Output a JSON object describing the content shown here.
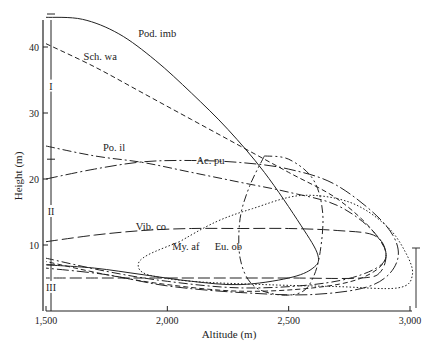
{
  "chart_data": {
    "type": "line",
    "title": "",
    "xlabel": "Altitude (m)",
    "ylabel": "Height (m)",
    "xlim": [
      1500,
      3050
    ],
    "ylim": [
      0,
      45
    ],
    "grid": false,
    "legend": "inline labels",
    "x_ticks": [
      {
        "value": 1500,
        "label": "1,500"
      },
      {
        "value": 2000,
        "label": "2,000"
      },
      {
        "value": 2500,
        "label": "2,500"
      },
      {
        "value": 3000,
        "label": "3,000"
      }
    ],
    "y_ticks": [
      {
        "value": 10,
        "label": "10"
      },
      {
        "value": 20,
        "label": "20"
      },
      {
        "value": 30,
        "label": "30"
      },
      {
        "value": 40,
        "label": "40"
      }
    ],
    "zones": [
      {
        "label": "I",
        "y_range": [
          23,
          45
        ]
      },
      {
        "label": "II",
        "y_range": [
          7,
          23
        ]
      },
      {
        "label": "III",
        "y_range": [
          0,
          7
        ]
      }
    ],
    "series": [
      {
        "name": "Pod. imb",
        "style": "solid",
        "label_pos": [
          1880,
          41.5
        ],
        "points": [
          [
            1500,
            44.5
          ],
          [
            1650,
            44.2
          ],
          [
            1800,
            42
          ],
          [
            1950,
            38
          ],
          [
            2100,
            33
          ],
          [
            2250,
            27.5
          ],
          [
            2400,
            21
          ],
          [
            2550,
            13
          ],
          [
            2620,
            8.5
          ],
          [
            2600,
            6.5
          ],
          [
            2500,
            5
          ],
          [
            2300,
            4
          ],
          [
            2100,
            4.5
          ],
          [
            1900,
            5.5
          ],
          [
            1700,
            6.5
          ],
          [
            1500,
            7
          ]
        ]
      },
      {
        "name": "Sch. wa",
        "style": "dashed",
        "label_pos": [
          1655,
          38
        ],
        "points": [
          [
            1500,
            40.5
          ],
          [
            1700,
            37
          ],
          [
            1900,
            33
          ],
          [
            2100,
            29
          ],
          [
            2300,
            25
          ],
          [
            2500,
            21
          ],
          [
            2700,
            17
          ],
          [
            2850,
            12
          ],
          [
            2900,
            8
          ],
          [
            2800,
            5
          ],
          [
            2600,
            3.5
          ],
          [
            2300,
            3
          ],
          [
            2000,
            4
          ],
          [
            1750,
            5.5
          ],
          [
            1500,
            7.5
          ]
        ]
      },
      {
        "name": "Po. il",
        "style": "dash-dot",
        "label_pos": [
          1735,
          24.2
        ],
        "points": [
          [
            1500,
            25
          ],
          [
            1700,
            23.5
          ],
          [
            1900,
            22.5
          ],
          [
            2100,
            21
          ],
          [
            2300,
            19.5
          ],
          [
            2500,
            18
          ],
          [
            2700,
            16
          ],
          [
            2850,
            12
          ],
          [
            2900,
            8
          ],
          [
            2800,
            5.5
          ],
          [
            2600,
            4
          ],
          [
            2300,
            3.5
          ],
          [
            2000,
            4.5
          ],
          [
            1750,
            6
          ],
          [
            1500,
            8
          ]
        ]
      },
      {
        "name": "Ac. pu",
        "style": "dash-dot-long",
        "label_pos": [
          2120,
          22.3
        ],
        "points": [
          [
            1500,
            20
          ],
          [
            1700,
            21.5
          ],
          [
            1900,
            22.6
          ],
          [
            2100,
            22.8
          ],
          [
            2300,
            22.5
          ],
          [
            2500,
            21.5
          ],
          [
            2700,
            19
          ],
          [
            2900,
            13
          ],
          [
            2950,
            8
          ],
          [
            2850,
            4
          ],
          [
            2600,
            2.5
          ],
          [
            2300,
            2.8
          ],
          [
            2000,
            3.8
          ],
          [
            1750,
            5.5
          ],
          [
            1500,
            6.5
          ]
        ]
      },
      {
        "name": "Vib. co",
        "style": "long-dash",
        "label_pos": [
          1870,
          12.2
        ],
        "points": [
          [
            1500,
            10.5
          ],
          [
            1700,
            11.5
          ],
          [
            1900,
            12.2
          ],
          [
            2100,
            12.5
          ],
          [
            2300,
            12.5
          ],
          [
            2500,
            12.5
          ],
          [
            2700,
            12.2
          ],
          [
            2850,
            11.5
          ],
          [
            2900,
            9
          ],
          [
            2880,
            6
          ],
          [
            2800,
            5
          ],
          [
            2500,
            5
          ],
          [
            2200,
            5
          ],
          [
            1900,
            5
          ],
          [
            1700,
            5
          ],
          [
            1500,
            5
          ]
        ]
      },
      {
        "name": "My. af",
        "style": "dotted",
        "label_pos": [
          2020,
          9.2
        ],
        "points": [
          [
            2050,
            10.5
          ],
          [
            1920,
            8.5
          ],
          [
            1880,
            7
          ],
          [
            1920,
            5.5
          ],
          [
            2100,
            4.5
          ],
          [
            2400,
            4
          ],
          [
            2700,
            3.7
          ],
          [
            2950,
            3.5
          ],
          [
            3010,
            5.5
          ],
          [
            2980,
            9
          ],
          [
            2900,
            13
          ],
          [
            2750,
            16.5
          ],
          [
            2550,
            17.5
          ],
          [
            2350,
            15.5
          ],
          [
            2200,
            13.5
          ],
          [
            2050,
            10.5
          ]
        ]
      },
      {
        "name": "Eu. ob",
        "style": "dash-dot-dot",
        "label_pos": [
          2195,
          9.2
        ],
        "points": [
          [
            2400,
            23.5
          ],
          [
            2500,
            23
          ],
          [
            2600,
            20
          ],
          [
            2640,
            15
          ],
          [
            2630,
            9
          ],
          [
            2600,
            5
          ],
          [
            2550,
            2.8
          ],
          [
            2450,
            2.5
          ],
          [
            2350,
            4
          ],
          [
            2300,
            8
          ],
          [
            2300,
            14
          ],
          [
            2340,
            19
          ],
          [
            2400,
            23.5
          ]
        ]
      }
    ]
  }
}
